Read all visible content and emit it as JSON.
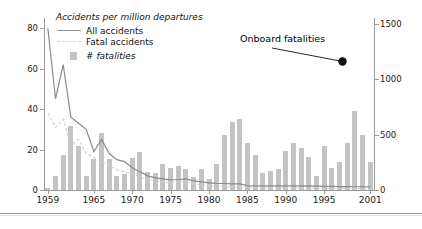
{
  "legend": {
    "title": "Accidents per million departures",
    "items": [
      {
        "label": "All accidents",
        "style": "solid-line",
        "color": "#8f8f8f"
      },
      {
        "label": "Fatal accidents",
        "style": "dashed-line",
        "color": "#cfcfcf"
      },
      {
        "label": "# fatalities",
        "style": "bar-swatch",
        "color": "#c3c3c3"
      }
    ]
  },
  "annotation": {
    "text": "Onboard fatalities",
    "points_to_year": 1996,
    "points_to_value": 1230
  },
  "axes": {
    "left_ticks": [
      "0",
      "20",
      "40",
      "60",
      "80"
    ],
    "right_ticks": [
      "0",
      "500",
      "1000",
      "1500"
    ],
    "x_ticks": [
      "1959",
      "1965",
      "1970",
      "1975",
      "1980",
      "1985",
      "1990",
      "1995",
      "2001"
    ]
  },
  "footnote": "",
  "chart_data": {
    "type": "bar",
    "title": "Accidents per million departures",
    "xlabel": "",
    "ylabel": "Accidents per million departures",
    "y2label": "# fatalities",
    "ylim": [
      0,
      85
    ],
    "y2lim": [
      0,
      1550
    ],
    "grid": false,
    "legend_position": "top-left",
    "x": [
      1959,
      1960,
      1961,
      1962,
      1963,
      1964,
      1965,
      1966,
      1967,
      1968,
      1969,
      1970,
      1971,
      1972,
      1973,
      1974,
      1975,
      1976,
      1977,
      1978,
      1979,
      1980,
      1981,
      1982,
      1983,
      1984,
      1985,
      1986,
      1987,
      1988,
      1989,
      1990,
      1991,
      1992,
      1993,
      1994,
      1995,
      1996,
      1997,
      1998,
      1999,
      2000,
      2001
    ],
    "series": [
      {
        "name": "# fatalities",
        "axis": "right",
        "type": "bar",
        "color": "#c3c3c3",
        "values": [
          20,
          130,
          320,
          580,
          400,
          130,
          280,
          510,
          280,
          130,
          140,
          290,
          340,
          160,
          150,
          230,
          200,
          220,
          190,
          120,
          190,
          100,
          230,
          500,
          610,
          640,
          420,
          320,
          150,
          170,
          190,
          350,
          420,
          380,
          300,
          130,
          400,
          200,
          250,
          420,
          710,
          500,
          250
        ]
      },
      {
        "name": "All accidents",
        "axis": "left",
        "type": "line",
        "color": "#8f8f8f",
        "values": [
          80,
          45,
          62,
          36,
          33,
          30,
          19,
          25,
          18,
          15,
          14,
          11,
          9,
          7,
          6,
          5.5,
          5,
          5.2,
          5.5,
          4.5,
          4,
          3.5,
          3.3,
          3.2,
          3,
          3,
          2.2,
          2,
          2,
          2,
          2,
          2,
          2,
          2,
          1.9,
          1.9,
          1.8,
          1.8,
          1.7,
          1.7,
          1.6,
          1.6,
          1.5
        ]
      },
      {
        "name": "Fatal accidents",
        "axis": "left",
        "type": "line-dashed",
        "color": "#cfcfcf",
        "values": [
          38,
          31,
          35,
          22,
          25,
          18,
          16,
          14,
          12,
          10,
          9,
          8,
          6.5,
          5,
          4.5,
          4,
          3.8,
          4.2,
          4,
          3,
          2.6,
          2,
          1.8,
          1.7,
          1.6,
          1.5,
          1.2,
          1.1,
          1.1,
          1,
          1,
          1,
          1,
          1,
          0.9,
          0.9,
          0.9,
          0.8,
          0.8,
          0.8,
          0.7,
          0.7,
          0.6
        ]
      }
    ]
  },
  "bar_pixels": {
    "note": "right-axis fatality values per year, rendered as bar heights",
    "values": [
      20,
      130,
      320,
      580,
      400,
      130,
      280,
      510,
      280,
      130,
      140,
      290,
      340,
      160,
      150,
      230,
      200,
      220,
      190,
      120,
      190,
      100,
      230,
      500,
      610,
      640,
      420,
      320,
      150,
      170,
      190,
      350,
      420,
      380,
      300,
      130,
      400,
      200,
      250,
      420,
      710,
      500,
      250
    ]
  }
}
